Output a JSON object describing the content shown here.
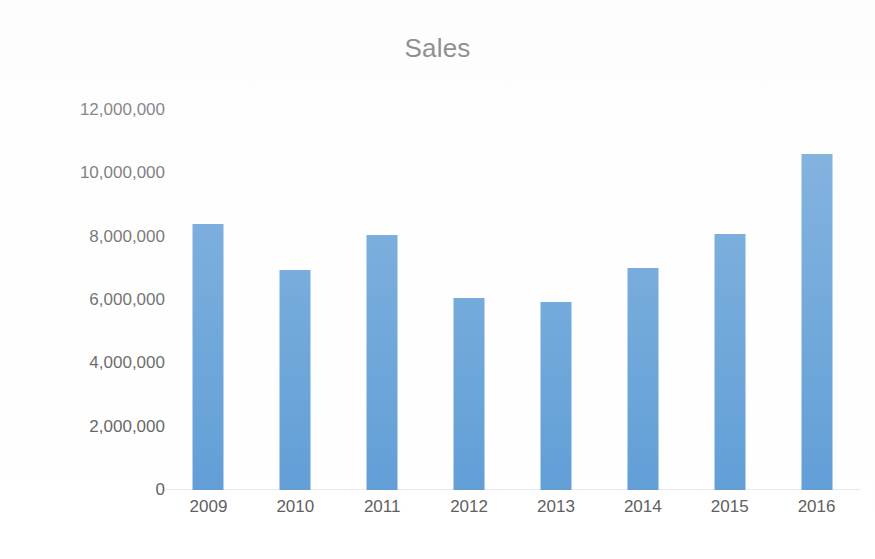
{
  "chart_data": {
    "type": "bar",
    "title": "Sales",
    "xlabel": "",
    "ylabel": "",
    "categories": [
      "2009",
      "2010",
      "2011",
      "2012",
      "2013",
      "2014",
      "2015",
      "2016"
    ],
    "values": [
      8400000,
      6950000,
      8050000,
      6050000,
      5950000,
      7000000,
      8100000,
      10600000
    ],
    "series": [
      {
        "name": "Sales",
        "values": [
          8400000,
          6950000,
          8050000,
          6050000,
          5950000,
          7000000,
          8100000,
          10600000
        ]
      }
    ],
    "ylim": [
      0,
      12000000
    ],
    "y_ticks": [
      0,
      2000000,
      4000000,
      6000000,
      8000000,
      10000000,
      12000000
    ],
    "y_tick_labels": [
      "0",
      "2,000,000",
      "4,000,000",
      "6,000,000",
      "8,000,000",
      "10,000,000",
      "12,000,000"
    ],
    "grid": false,
    "legend": false,
    "legend_position": "none",
    "bar_color": "#5b9bd5",
    "title_color": "#5d5d5d",
    "tick_label_color": "#5a5a5a",
    "background_color": "#ffffff"
  }
}
